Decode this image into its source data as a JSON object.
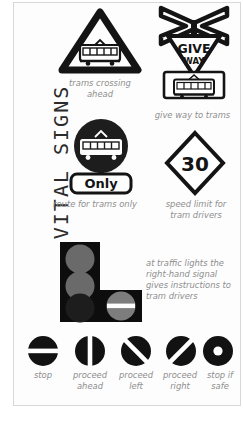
{
  "page": {
    "title": "VITAL SIGNS",
    "background_color": "#ffffff",
    "card_border_color": "#d8d8d8",
    "caption_color": "#8d8d8d",
    "ink_color": "#1a1a1a"
  },
  "signs": [
    {
      "id": "trams-crossing-ahead",
      "icon": "warning-triangle-tram-icon",
      "caption": "trams crossing\nahead",
      "shape": "triangle",
      "symbol": "tram"
    },
    {
      "id": "give-way-to-trams",
      "icon": "crossbuck-giveway-tram-icon",
      "caption": "give way to trams",
      "shape": "crossbuck-and-triangle-and-plate",
      "text_primary": "GIVE",
      "text_secondary": "WAY",
      "symbol": "tram"
    },
    {
      "id": "route-for-trams-only",
      "icon": "circle-tram-only-icon",
      "caption": "route for trams only",
      "shape": "circle",
      "symbol": "tram",
      "plate_text": "Only"
    },
    {
      "id": "speed-limit-for-tram-drivers",
      "icon": "diamond-speed-limit-icon",
      "caption": "speed limit for\ntram drivers",
      "shape": "diamond",
      "value": "30"
    }
  ],
  "signal_head": {
    "id": "tram-traffic-signal-head",
    "icon": "tram-signal-head-icon",
    "caption": "at traffic lights the\nright-hand signal\ngives instructions to\ntram drivers",
    "layout": "L-shape",
    "lamps": [
      {
        "position": "top-left",
        "state": "off",
        "marking": "none",
        "color": "#6a6a6a"
      },
      {
        "position": "middle-left",
        "state": "off",
        "marking": "none",
        "color": "#6a6a6a"
      },
      {
        "position": "bottom-left",
        "state": "off",
        "marking": "none",
        "color": "#1d1d1d"
      },
      {
        "position": "bottom-right",
        "state": "lit",
        "marking": "horizontal-bar",
        "color": "#7d7d7d"
      }
    ],
    "body_color": "#0d0d0d"
  },
  "aspects": {
    "items": [
      {
        "id": "stop",
        "icon": "signal-horizontal-bar-icon",
        "marking": "horizontal-bar",
        "label": "stop"
      },
      {
        "id": "proceed-ahead",
        "icon": "signal-vertical-bar-icon",
        "marking": "vertical-bar",
        "label": "proceed\nahead"
      },
      {
        "id": "proceed-left",
        "icon": "signal-backslash-bar-icon",
        "marking": "diagonal-left",
        "label": "proceed\nleft"
      },
      {
        "id": "proceed-right",
        "icon": "signal-slash-bar-icon",
        "marking": "diagonal-right",
        "label": "proceed\nright"
      },
      {
        "id": "stop-if-safe",
        "icon": "signal-dot-icon",
        "marking": "dot",
        "label": "stop if\nsafe"
      }
    ]
  }
}
